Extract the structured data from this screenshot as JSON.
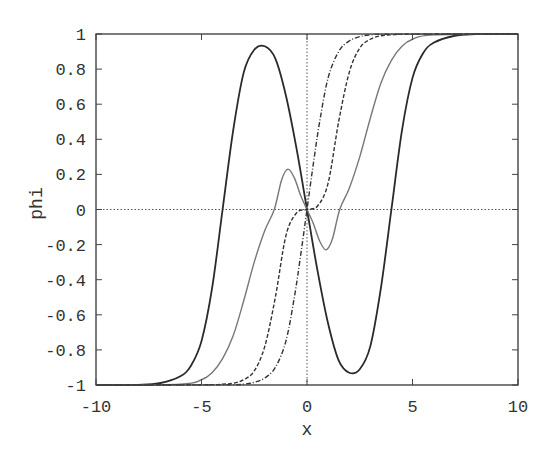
{
  "chart_data": {
    "type": "line",
    "title": "",
    "xlabel": "x",
    "ylabel": "phi",
    "xlim": [
      -10,
      10
    ],
    "ylim": [
      -1,
      1
    ],
    "xticks": [
      -10,
      -5,
      0,
      5,
      10
    ],
    "xtick_labels": [
      "-10",
      "-5",
      "0",
      "5",
      "10"
    ],
    "yticks": [
      -1,
      -0.8,
      -0.6,
      -0.4,
      -0.2,
      0,
      0.2,
      0.4,
      0.6,
      0.8,
      1
    ],
    "ytick_labels": [
      "-1",
      "-0.8",
      "-0.6",
      "-0.4",
      "-0.2",
      "0",
      "0.2",
      "0.4",
      "0.6",
      "0.8",
      "1"
    ],
    "grid": false,
    "zero_lines": true,
    "legend": null,
    "series": [
      {
        "name": "solid-dark",
        "style": "solid",
        "color": "#2a2a2a",
        "x": [
          -10,
          -8,
          -7,
          -6,
          -5.5,
          -5,
          -4.5,
          -4,
          -3.5,
          -3,
          -2.5,
          -2,
          -1.5,
          -1,
          -0.5,
          0,
          0.5,
          1,
          1.5,
          2,
          2.5,
          3,
          3.5,
          4,
          4.5,
          5,
          5.5,
          6,
          7,
          8,
          10
        ],
        "y": [
          -1,
          -0.999,
          -0.99,
          -0.95,
          -0.89,
          -0.75,
          -0.45,
          0,
          0.45,
          0.78,
          0.91,
          0.93,
          0.86,
          0.65,
          0.35,
          0,
          -0.35,
          -0.65,
          -0.86,
          -0.93,
          -0.91,
          -0.78,
          -0.45,
          0,
          0.45,
          0.75,
          0.89,
          0.95,
          0.99,
          0.999,
          1
        ]
      },
      {
        "name": "solid-gray",
        "style": "solid",
        "color": "#777777",
        "x": [
          -10,
          -6,
          -5,
          -4.5,
          -4,
          -3.5,
          -3,
          -2.5,
          -2,
          -1.55,
          -1.2,
          -0.9,
          -0.6,
          -0.3,
          0,
          0.3,
          0.6,
          0.9,
          1.2,
          1.55,
          2,
          2.5,
          3,
          3.5,
          4,
          4.5,
          5,
          6,
          10
        ],
        "y": [
          -1,
          -0.995,
          -0.97,
          -0.93,
          -0.85,
          -0.72,
          -0.52,
          -0.3,
          -0.12,
          0,
          0.17,
          0.23,
          0.18,
          0.08,
          0,
          -0.08,
          -0.18,
          -0.23,
          -0.17,
          0,
          0.12,
          0.3,
          0.52,
          0.72,
          0.85,
          0.93,
          0.97,
          0.995,
          1
        ]
      },
      {
        "name": "dashed",
        "style": "dashed",
        "color": "#333333",
        "x": [
          -10,
          -5,
          -4,
          -3.5,
          -3,
          -2.5,
          -2,
          -1.5,
          -1,
          -0.5,
          0,
          0.5,
          1,
          1.5,
          2,
          2.5,
          3,
          3.5,
          4,
          5,
          10
        ],
        "y": [
          -1,
          -0.999,
          -0.995,
          -0.99,
          -0.97,
          -0.92,
          -0.78,
          -0.5,
          -0.15,
          -0.02,
          0,
          0.02,
          0.15,
          0.5,
          0.78,
          0.92,
          0.97,
          0.99,
          0.995,
          0.999,
          1
        ]
      },
      {
        "name": "dash-dot",
        "style": "dashdot",
        "color": "#333333",
        "x": [
          -10,
          -4,
          -3,
          -2.5,
          -2,
          -1.5,
          -1,
          -0.6,
          -0.3,
          0,
          0.3,
          0.6,
          1,
          1.5,
          2,
          2.5,
          3,
          4,
          10
        ],
        "y": [
          -1,
          -0.999,
          -0.995,
          -0.985,
          -0.96,
          -0.9,
          -0.75,
          -0.5,
          -0.26,
          0,
          0.26,
          0.5,
          0.75,
          0.9,
          0.96,
          0.985,
          0.995,
          0.999,
          1
        ]
      }
    ]
  }
}
